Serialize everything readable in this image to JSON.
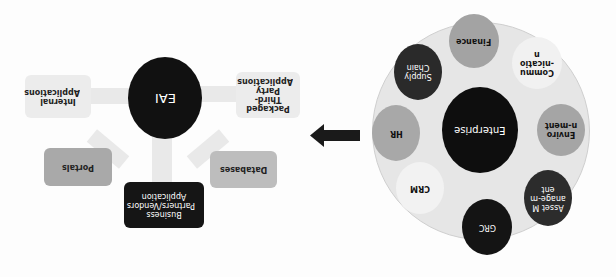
{
  "eai_diagram": {
    "hub": {
      "label": "EAI",
      "color": "#111111"
    },
    "sources": [
      {
        "id": "internal",
        "label": "Internal Applications",
        "color": "#ececec",
        "text_color": "#222222"
      },
      {
        "id": "packaged",
        "label": "Packaged Third-Party Applications",
        "color": "#ececec",
        "text_color": "#222222"
      },
      {
        "id": "portals",
        "label": "Portals",
        "color": "#a9a9a9",
        "text_color": "#222222"
      },
      {
        "id": "business",
        "label": "Business Partners/Vendors Application",
        "color": "#151515",
        "text_color": "#ffffff"
      },
      {
        "id": "databases",
        "label": "Databases",
        "color": "#bdbdbd",
        "text_color": "#222222"
      }
    ]
  },
  "transition_arrow": {
    "direction": "left",
    "color": "#1a1a1a"
  },
  "enterprise_diagram": {
    "hub": {
      "label": "Enterprise",
      "color": "#0e0e0e"
    },
    "ring_color": "#e6e6e6",
    "modules": [
      {
        "id": "finance",
        "label": "Finance",
        "color": "#a3a3a3",
        "text_color": "#111111"
      },
      {
        "id": "supply-chain",
        "label": "Supply Chain",
        "color": "#2a2a2a",
        "text_color": "#ffffff"
      },
      {
        "id": "communication",
        "label": "Commu-nication",
        "color": "#f1f1f1",
        "text_color": "#111111"
      },
      {
        "id": "hr",
        "label": "HR",
        "color": "#a8a8a8",
        "text_color": "#111111"
      },
      {
        "id": "environment",
        "label": "Environ-ment",
        "color": "#a5a5a5",
        "text_color": "#111111"
      },
      {
        "id": "crm",
        "label": "CRM",
        "color": "#f2f2f2",
        "text_color": "#111111"
      },
      {
        "id": "asset-management",
        "label": "Asset Manage-ment",
        "color": "#2c2c2c",
        "text_color": "#ffffff"
      },
      {
        "id": "grc",
        "label": "GRC",
        "color": "#141414",
        "text_color": "#ffffff"
      }
    ]
  }
}
